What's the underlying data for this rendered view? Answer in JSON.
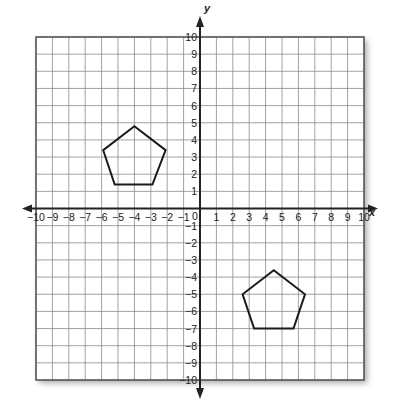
{
  "chart_data": {
    "type": "coordinate-grid",
    "title": "",
    "xlabel": "x",
    "ylabel": "y",
    "xlim": [
      -10,
      10
    ],
    "ylim": [
      -10,
      10
    ],
    "grid": true,
    "x_ticks": [
      -10,
      -9,
      -8,
      -7,
      -6,
      -5,
      -4,
      -3,
      -2,
      -1,
      1,
      2,
      3,
      4,
      5,
      6,
      7,
      8,
      9,
      10
    ],
    "y_ticks": [
      -10,
      -9,
      -8,
      -7,
      -6,
      -5,
      -4,
      -3,
      -2,
      -1,
      1,
      2,
      3,
      4,
      5,
      6,
      7,
      8,
      9,
      10
    ],
    "x_tick_labels": [
      "−10",
      "−9",
      "−8",
      "−7",
      "−6",
      "−5",
      "−4",
      "−3",
      "−2",
      "−1",
      "1",
      "2",
      "3",
      "4",
      "5",
      "6",
      "7",
      "8",
      "9",
      "10"
    ],
    "y_tick_labels": [
      "−10",
      "−9",
      "−8",
      "−7",
      "−6",
      "−5",
      "−4",
      "−3",
      "−2",
      "−1",
      "1",
      "2",
      "3",
      "4",
      "5",
      "6",
      "7",
      "8",
      "9",
      "10"
    ],
    "origin_label": "0",
    "shapes": [
      {
        "name": "pentagon-1",
        "type": "polygon",
        "vertices": [
          [
            -4,
            4.8
          ],
          [
            -2.1,
            3.4
          ],
          [
            -2.9,
            1.4
          ],
          [
            -5.2,
            1.4
          ],
          [
            -5.9,
            3.4
          ]
        ]
      },
      {
        "name": "pentagon-2",
        "type": "polygon",
        "vertices": [
          [
            4.5,
            -3.6
          ],
          [
            6.4,
            -5
          ],
          [
            5.7,
            -7
          ],
          [
            3.3,
            -7
          ],
          [
            2.6,
            -5
          ]
        ]
      }
    ]
  },
  "axes": {
    "x_label": "x",
    "y_label": "y",
    "origin": "0"
  },
  "colors": {
    "grid": "#8a8a8a",
    "axis": "#222222",
    "shape": "#1a1a1a",
    "background": "#ffffff"
  }
}
